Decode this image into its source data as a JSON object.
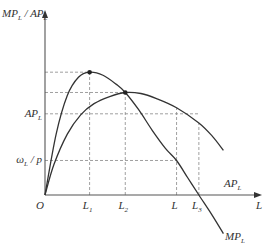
{
  "chart_data": {
    "type": "line",
    "title": "",
    "xlabel": "L",
    "ylabel": "MP_L / AP_L",
    "origin_label": "O",
    "x_ticks": [
      {
        "key": "L1",
        "base": "L",
        "sub": "1",
        "x": 2
      },
      {
        "key": "L2",
        "base": "L",
        "sub": "2",
        "x": 3.6
      },
      {
        "key": "L",
        "base": "L",
        "sub": "",
        "x": 5.9
      },
      {
        "key": "L3",
        "base": "L",
        "sub": "3",
        "x": 6.9
      }
    ],
    "y_ticks": [
      {
        "key": "AP_L",
        "base": "AP",
        "sub": "L",
        "y": 4.0
      },
      {
        "key": "wage_over_price",
        "base": "ω",
        "sub": "L",
        "suffix": " / p",
        "y": 1.7
      }
    ],
    "xlim": [
      0,
      10
    ],
    "ylim": [
      0,
      8.2
    ],
    "series": [
      {
        "name": "MP_L",
        "label_base": "MP",
        "label_sub": "L",
        "points": [
          [
            0,
            0
          ],
          [
            0.5,
            3.0
          ],
          [
            1.0,
            4.9
          ],
          [
            1.5,
            5.8
          ],
          [
            2.0,
            6.05
          ],
          [
            2.6,
            5.9
          ],
          [
            3.2,
            5.45
          ],
          [
            3.6,
            5.05
          ],
          [
            4.2,
            4.2
          ],
          [
            4.8,
            3.2
          ],
          [
            5.4,
            2.3
          ],
          [
            5.9,
            1.7
          ],
          [
            6.4,
            0.85
          ],
          [
            6.9,
            0.0
          ],
          [
            7.5,
            -1.0
          ],
          [
            8.0,
            -1.9
          ]
        ]
      },
      {
        "name": "AP_L",
        "label_base": "AP",
        "label_sub": "L",
        "points": [
          [
            0,
            0
          ],
          [
            0.4,
            1.5
          ],
          [
            1.0,
            3.0
          ],
          [
            1.6,
            3.95
          ],
          [
            2.2,
            4.5
          ],
          [
            2.9,
            4.85
          ],
          [
            3.6,
            5.05
          ],
          [
            4.3,
            5.0
          ],
          [
            5.0,
            4.75
          ],
          [
            5.9,
            4.3
          ],
          [
            6.9,
            3.55
          ],
          [
            7.5,
            2.9
          ],
          [
            8.0,
            2.2
          ]
        ]
      }
    ],
    "highlighted_points": [
      {
        "name": "MP_L maximum",
        "x": 2,
        "y": 6.05
      },
      {
        "name": "MP_L = AP_L (AP_L maximum)",
        "x": 3.6,
        "y": 5.05
      }
    ],
    "guide_lines": [
      {
        "type": "h",
        "y": 6.05,
        "x_to": 2
      },
      {
        "type": "h",
        "y": 5.05,
        "x_to": 3.6
      },
      {
        "type": "h",
        "y": 4.0,
        "x_to": 6.9
      },
      {
        "type": "h",
        "y": 1.7,
        "x_to": 5.9
      },
      {
        "type": "v",
        "x": 2,
        "y_to": 6.05
      },
      {
        "type": "v",
        "x": 3.6,
        "y_to": 5.05
      },
      {
        "type": "v",
        "x": 5.9,
        "y_to": 4.3
      },
      {
        "type": "v",
        "x": 6.9,
        "y_to": 3.55
      }
    ],
    "grid": false,
    "legend": "none"
  }
}
